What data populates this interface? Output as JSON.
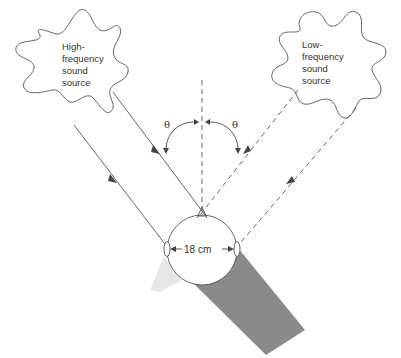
{
  "diagram": {
    "high_source": {
      "lines": [
        "High-",
        "frequency",
        "sound",
        "source"
      ]
    },
    "low_source": {
      "lines": [
        "Low-",
        "frequency",
        "sound",
        "source"
      ]
    },
    "angle_label_left": "θ",
    "angle_label_right": "θ",
    "head_width_label": "18 cm",
    "colors": {
      "line": "#555555",
      "shadow_dark": "#8a8a8a",
      "shadow_light": "#e6e6e6",
      "text": "#333333"
    }
  }
}
